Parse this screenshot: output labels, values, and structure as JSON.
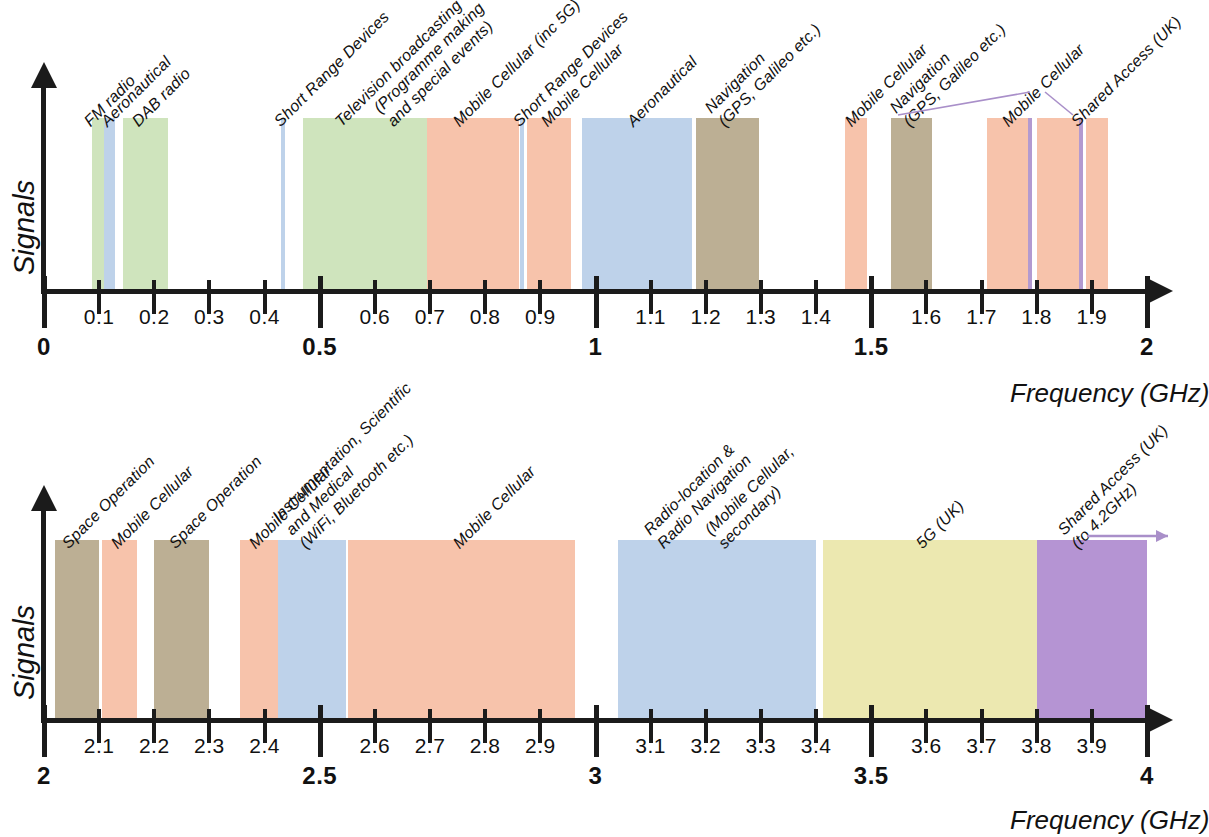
{
  "figure": {
    "y_axis_label": "Signals",
    "x_axis_label": "Frequency (GHz)"
  },
  "chart_data": {
    "type": "bar",
    "xlabel": "Frequency (GHz)",
    "ylabel": "Signals",
    "grid": false,
    "legend": "none",
    "colors": {
      "green": "#cfe4bd",
      "pink": "#f7c3ab",
      "blue": "#bed2ea",
      "tan": "#bcaf94",
      "purple_line": "#b39ad0",
      "yellow": "#ece8b0",
      "purple": "#b594d3"
    },
    "panels": [
      {
        "name": "panel-0-2ghz",
        "xlim": [
          0,
          2
        ],
        "ticks_minor": [
          "0.1",
          "0.2",
          "0.3",
          "0.4",
          "0.6",
          "0.7",
          "0.8",
          "0.9",
          "1.1",
          "1.2",
          "1.3",
          "1.4",
          "1.6",
          "1.7",
          "1.8",
          "1.9"
        ],
        "ticks_major": [
          "0",
          "0.5",
          "1",
          "1.5",
          "2"
        ],
        "bands": [
          {
            "label": "FM radio",
            "start": 0.087,
            "end": 0.108,
            "color": "green"
          },
          {
            "label": "Aeronautical",
            "start": 0.108,
            "end": 0.128,
            "color": "blue"
          },
          {
            "label": "DAB radio",
            "start": 0.144,
            "end": 0.225,
            "color": "green"
          },
          {
            "label": "Short Range Devices",
            "start": 0.43,
            "end": 0.437,
            "color": "blue"
          },
          {
            "label": "Television broadcasting",
            "start": 0.47,
            "end": 0.694,
            "color": "green"
          },
          {
            "label": "(Programme making\nand special events)",
            "start": 0.694,
            "end": 0.862,
            "color": "pink"
          },
          {
            "label": "Mobile Cellular (inc 5G)",
            "start": 0.863,
            "end": 0.871,
            "color": "blue"
          },
          {
            "label": "Short Range Devices",
            "start": 0.876,
            "end": 0.955,
            "color": "pink"
          },
          {
            "label": "Mobile Cellular",
            "start": 0.975,
            "end": 1.175,
            "color": "blue"
          },
          {
            "label": "Aeronautical",
            "start": 1.182,
            "end": 1.296,
            "color": "tan"
          },
          {
            "label": "Navigation\n(GPS, Galileo etc.)",
            "start": 1.452,
            "end": 1.492,
            "color": "pink"
          },
          {
            "label": "Mobile Cellular",
            "start": 1.536,
            "end": 1.61,
            "color": "tan"
          },
          {
            "label": "Navigation\n(GPS, Galileo etc.)",
            "start": 1.71,
            "end": 1.784,
            "color": "pink"
          },
          {
            "label": "Mobile Cellular",
            "start": 1.784,
            "end": 1.791,
            "color": "purple_line"
          },
          {
            "label": "Shared Access (UK)",
            "start": 1.8,
            "end": 1.877,
            "color": "pink"
          },
          {
            "label": "",
            "start": 1.877,
            "end": 1.884,
            "color": "purple_line"
          },
          {
            "label": "",
            "start": 1.89,
            "end": 1.93,
            "color": "pink"
          }
        ],
        "captions": [
          {
            "text": "FM radio",
            "at": 0.09
          },
          {
            "text": "Aeronautical",
            "at": 0.122
          },
          {
            "text": "DAB radio",
            "at": 0.178
          },
          {
            "text": "Short Range Devices",
            "at": 0.435
          },
          {
            "text": "Television broadcasting",
            "at": 0.545
          },
          {
            "text": "(Programme making\nand special events)",
            "at": 0.64
          },
          {
            "text": "Mobile Cellular (inc 5G)",
            "at": 0.76
          },
          {
            "text": "Short Range Devices",
            "at": 0.868
          },
          {
            "text": "Mobile Cellular",
            "at": 0.92
          },
          {
            "text": "Aeronautical",
            "at": 1.075
          },
          {
            "text": "Navigation\n(GPS, Galileo etc.)",
            "at": 1.24
          },
          {
            "text": "Mobile Cellular",
            "at": 1.47
          },
          {
            "text": "Navigation\n(GPS, Galileo etc.)",
            "at": 1.575
          },
          {
            "text": "Mobile Cellular",
            "at": 1.755
          },
          {
            "text": "Shared Access (UK)",
            "at": 1.88
          }
        ]
      },
      {
        "name": "panel-2-4ghz",
        "xlim": [
          2,
          4
        ],
        "ticks_minor": [
          "2.1",
          "2.2",
          "2.3",
          "2.4",
          "2.6",
          "2.7",
          "2.8",
          "2.9",
          "3.1",
          "3.2",
          "3.3",
          "3.4",
          "3.6",
          "3.7",
          "3.8",
          "3.9"
        ],
        "ticks_major": [
          "2",
          "2.5",
          "3",
          "3.5",
          "4"
        ],
        "bands": [
          {
            "label": "Space Operation",
            "start": 2.02,
            "end": 2.1,
            "color": "tan"
          },
          {
            "label": "Mobile Cellular",
            "start": 2.105,
            "end": 2.168,
            "color": "pink"
          },
          {
            "label": "Space Operation",
            "start": 2.2,
            "end": 2.3,
            "color": "tan"
          },
          {
            "label": "Mobile Cellular",
            "start": 2.355,
            "end": 2.425,
            "color": "pink"
          },
          {
            "label": "Instrumentation, Scientific\nand Medical\n(WiFi, Bluetooth etc.)",
            "start": 2.425,
            "end": 2.548,
            "color": "blue"
          },
          {
            "label": "Mobile Cellular",
            "start": 2.552,
            "end": 2.962,
            "color": "pink"
          },
          {
            "label": "Radio-location &\nRadio Navigation\n(Mobile Cellular,\nsecondary)",
            "start": 3.04,
            "end": 3.4,
            "color": "blue"
          },
          {
            "label": "5G (UK)",
            "start": 3.412,
            "end": 3.8,
            "color": "yellow"
          },
          {
            "label": "Shared Access (UK)\n(to 4.2GHz)",
            "start": 3.8,
            "end": 4.0,
            "color": "purple"
          }
        ],
        "captions": [
          {
            "text": "Space Operation",
            "at": 2.05
          },
          {
            "text": "Mobile Cellular",
            "at": 2.14
          },
          {
            "text": "Space Operation",
            "at": 2.245
          },
          {
            "text": "Mobile Cellular",
            "at": 2.39
          },
          {
            "text": "Instrumentation, Scientific\nand Medical\n(WiFi, Bluetooth etc.)",
            "at": 2.48
          },
          {
            "text": "Mobile Cellular",
            "at": 2.76
          },
          {
            "text": "Radio-location &\nRadio Navigation",
            "at": 3.13
          },
          {
            "text": "(Mobile Cellular,\nsecondary)",
            "at": 3.24
          },
          {
            "text": "5G (UK)",
            "at": 3.6
          },
          {
            "text": "Shared Access (UK)\n(to 4.2GHz)",
            "at": 3.88
          }
        ]
      }
    ]
  }
}
